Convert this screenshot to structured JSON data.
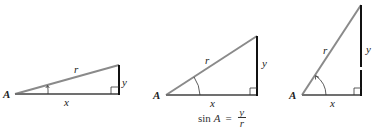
{
  "colors": {
    "hypotenuse": "#8a8a8a",
    "base": "#707070",
    "opposite": "#111111",
    "text": "#222222"
  },
  "triangles": [
    {
      "id": "triangle-small-angle",
      "vertex_label": "A",
      "hyp_label": "r",
      "adj_label": "x",
      "opp_label": "y",
      "points": {
        "A": [
          15,
          94
        ],
        "C": [
          119,
          94
        ],
        "B": [
          119,
          65
        ]
      }
    },
    {
      "id": "triangle-medium-angle",
      "vertex_label": "A",
      "hyp_label": "r",
      "adj_label": "x",
      "opp_label": "y",
      "points": {
        "A": [
          166,
          95
        ],
        "C": [
          257,
          95
        ],
        "B": [
          257,
          36
        ]
      }
    },
    {
      "id": "triangle-large-angle",
      "vertex_label": "A",
      "hyp_label": "r",
      "adj_label": "x",
      "opp_label": "y",
      "points": {
        "A": [
          302,
          95
        ],
        "C": [
          361,
          95
        ],
        "B": [
          361,
          5
        ]
      }
    }
  ],
  "formula": {
    "lhs": "sin",
    "variable": "A",
    "equals": "=",
    "numerator": "y",
    "denominator": "r"
  }
}
